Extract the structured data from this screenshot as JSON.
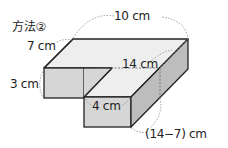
{
  "title": "方法②",
  "labels": {
    "depth": "7 cm",
    "length": "10 cm",
    "height": "3 cm",
    "inner_length": "14 cm",
    "arm_width": "4 cm",
    "difference": "(14−7) cm"
  },
  "colors": {
    "top_face": "#eeeeee",
    "front_face": "#d6d6d6",
    "side_face": "#bdbdbd",
    "edge": "#222222",
    "dashed": "#888888"
  }
}
